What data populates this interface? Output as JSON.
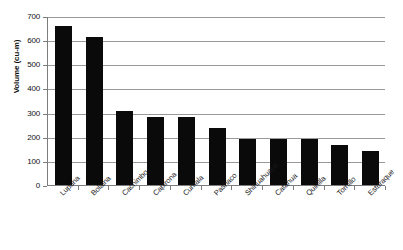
{
  "chart_data": {
    "type": "bar",
    "title": "",
    "xlabel": "",
    "ylabel": "Volume (cu-m)",
    "ylim": [
      0,
      700
    ],
    "ytick_step": 100,
    "yticks": [
      700,
      600,
      500,
      400,
      300,
      200,
      100,
      0
    ],
    "grid": true,
    "legend": "none",
    "bar_color": "#0a0a0a",
    "categories": [
      "Lupuna",
      "Bolaina",
      "Cachimbo",
      "Capirona",
      "Cumala",
      "Pashaco",
      "Shihuahuaco",
      "Catahua",
      "Quinilla",
      "Tornillo",
      "Estoraque"
    ],
    "values": [
      660,
      615,
      307,
      283,
      283,
      235,
      190,
      190,
      190,
      165,
      140
    ],
    "series": [
      {
        "name": "Volume",
        "values": [
          660,
          615,
          307,
          283,
          283,
          235,
          190,
          190,
          190,
          165,
          140
        ]
      }
    ]
  },
  "axis": {
    "y_title": "Volume (cu-m)"
  }
}
